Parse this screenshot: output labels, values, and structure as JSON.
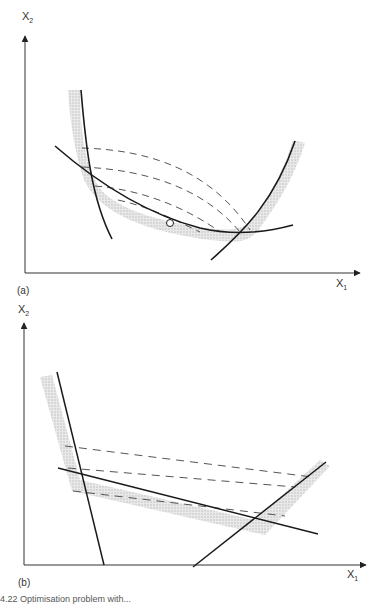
{
  "figure": {
    "panels": [
      {
        "id": "a",
        "label": "(a)",
        "x_axis": {
          "name": "X",
          "sub": "1"
        },
        "y_axis": {
          "name": "X",
          "sub": "2"
        },
        "description": "Two curved constraint boundaries (steep left, rising right) intersecting a convex curved boundary; dashed curved contours; shaded feasible-side band; open circle marks a point on the lower curve"
      },
      {
        "id": "b",
        "label": "(b)",
        "x_axis": {
          "name": "X",
          "sub": "1"
        },
        "y_axis": {
          "name": "X",
          "sub": "2"
        },
        "description": "Linear version: three straight constraint lines forming a region with shaded band; three straight dashed contour lines"
      }
    ],
    "caption_fragment": "4.22  Optimisation problem with..."
  },
  "colors": {
    "line": "#1a1a1a",
    "shade": "#c8c8c8",
    "dash": "#555555",
    "axis": "#333333"
  }
}
